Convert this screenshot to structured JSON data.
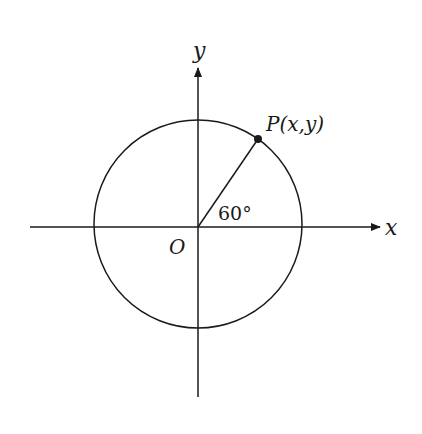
{
  "diagram": {
    "type": "unit-circle",
    "axes": {
      "x_label": "x",
      "y_label": "y",
      "origin_label": "O"
    },
    "point": {
      "label": "P(x,y)",
      "angle_deg": 60
    },
    "angle_label": "60°",
    "colors": {
      "stroke": "#1a1a1a",
      "background": "#ffffff"
    }
  }
}
